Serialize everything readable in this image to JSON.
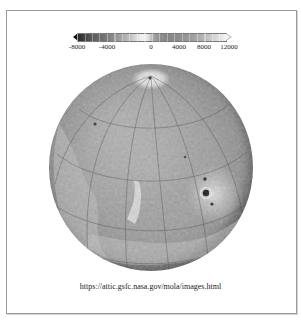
{
  "figure": {
    "colorbar": {
      "tick_labels": [
        "-8000",
        "-4000",
        "0",
        "4000",
        "8000",
        "12000"
      ],
      "tick_positions_px": [
        4,
        34,
        78,
        106,
        131,
        156
      ],
      "min": -8000,
      "max": 12000,
      "extend": "both",
      "colormap": "grayscale"
    },
    "globe": {
      "projection": "orthographic",
      "graticule": true,
      "features": [
        "north-polar-cap",
        "tharsis-volcanoes",
        "valles-marineris",
        "olympus-mons"
      ]
    },
    "caption": "https://attic.gsfc.nasa.gov/mola/images.html"
  }
}
